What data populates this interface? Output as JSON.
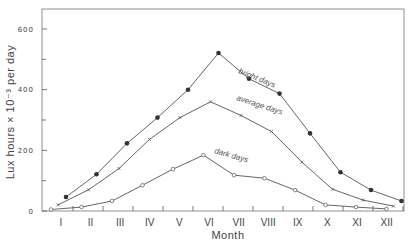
{
  "chart_data": {
    "type": "line",
    "title": "",
    "xlabel": "Month",
    "ylabel": "Lux hours × 10⁻³ per day",
    "categories": [
      "I",
      "II",
      "III",
      "IV",
      "V",
      "VI",
      "VII",
      "VIII",
      "IX",
      "X",
      "XI",
      "XII"
    ],
    "yticks": [
      0,
      200,
      400,
      600
    ],
    "ylim": [
      0,
      650
    ],
    "grid": false,
    "legend": "inline labels on curves",
    "series": [
      {
        "name": "bright days",
        "marker": "filled-circle",
        "values": [
          46,
          121,
          223,
          308,
          400,
          521,
          436,
          387,
          256,
          128,
          69,
          33
        ]
      },
      {
        "name": "average days",
        "marker": "cross",
        "values": [
          20,
          70,
          140,
          236,
          308,
          360,
          315,
          262,
          161,
          72,
          36,
          16
        ]
      },
      {
        "name": "dark days",
        "marker": "open-circle",
        "values": [
          5,
          13,
          33,
          85,
          138,
          184,
          118,
          108,
          69,
          20,
          13,
          7
        ]
      }
    ]
  }
}
